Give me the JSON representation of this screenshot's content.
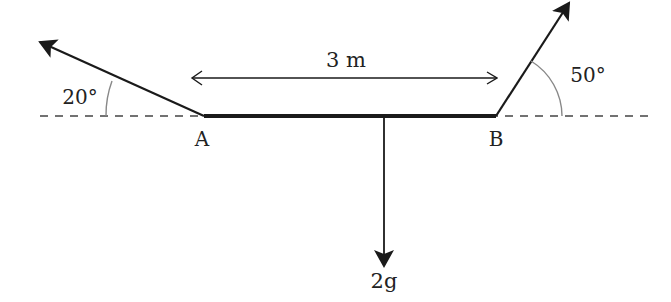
{
  "diagram": {
    "length_label": "3 m",
    "point_a": "A",
    "point_b": "B",
    "angle_left": "20°",
    "angle_right": "50°",
    "weight_label": "2g",
    "colors": {
      "line": "#1a1a1a",
      "arc": "#888888",
      "dash": "#444444"
    }
  }
}
